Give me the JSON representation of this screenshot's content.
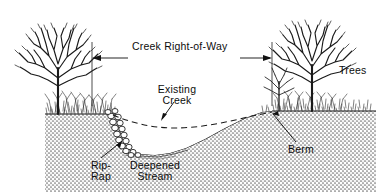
{
  "figure": {
    "kind": "cross-section-diagram",
    "background_color": "#ffffff",
    "ink_color": "#111111",
    "ground_fill_color": "#c9c9c9"
  },
  "labels": {
    "right_of_way": "Creek Right-of-Way",
    "trees": "Trees",
    "existing_creek_line1": "Existing",
    "existing_creek_line2": "Creek",
    "rip_rap_line1": "Rip-",
    "rip_rap_line2": "Rap",
    "deepened_line1": "Deepened",
    "deepened_line2": "Stream",
    "berm": "Berm"
  },
  "annotations": [
    {
      "name": "right-of-way-dimension",
      "text": "Creek Right-of-Way",
      "style": "double-headed-horizontal-arrow",
      "from_x": 92,
      "to_x": 272,
      "y": 58
    },
    {
      "name": "existing-creek-leader",
      "text": "Existing Creek",
      "style": "leader-with-arrowhead",
      "tip_x": 161,
      "tip_y": 121
    },
    {
      "name": "rip-rap-leader",
      "text": "Rip-Rap",
      "style": "leader-with-arrowhead",
      "tip_x": 121,
      "tip_y": 142
    },
    {
      "name": "berm-leader",
      "text": "Berm",
      "style": "leader-with-arrowhead",
      "tip_x": 272,
      "tip_y": 114
    }
  ],
  "features": {
    "left_bank_ground_y": 114,
    "right_bank_ground_y": 111,
    "channel_bottom_y": 154,
    "rip_rap_bank_x": 116,
    "existing_creek_style": "dashed",
    "tree_count_left": 1,
    "tree_count_right": 2,
    "tree_type": "bare deciduous"
  }
}
